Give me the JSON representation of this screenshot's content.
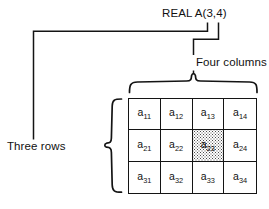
{
  "figure": {
    "title_label": "REAL A(3,4)",
    "columns_label": "Four columns",
    "rows_label": "Three rows"
  },
  "matrix": {
    "rows": 3,
    "columns": 4,
    "highlighted_cell": "a23",
    "cells": [
      [
        {
          "base": "a",
          "sub": "11",
          "shaded": false
        },
        {
          "base": "a",
          "sub": "12",
          "shaded": false
        },
        {
          "base": "a",
          "sub": "13",
          "shaded": false
        },
        {
          "base": "a",
          "sub": "14",
          "shaded": false
        }
      ],
      [
        {
          "base": "a",
          "sub": "21",
          "shaded": false
        },
        {
          "base": "a",
          "sub": "22",
          "shaded": false
        },
        {
          "base": "a",
          "sub": "23",
          "shaded": true
        },
        {
          "base": "a",
          "sub": "24",
          "shaded": false
        }
      ],
      [
        {
          "base": "a",
          "sub": "31",
          "shaded": false
        },
        {
          "base": "a",
          "sub": "32",
          "shaded": false
        },
        {
          "base": "a",
          "sub": "33",
          "shaded": false
        },
        {
          "base": "a",
          "sub": "34",
          "shaded": false
        }
      ]
    ]
  },
  "colors": {
    "ink": "#141414",
    "text": "#111111",
    "background": "#ffffff",
    "stipple": "#4a4a4a"
  }
}
